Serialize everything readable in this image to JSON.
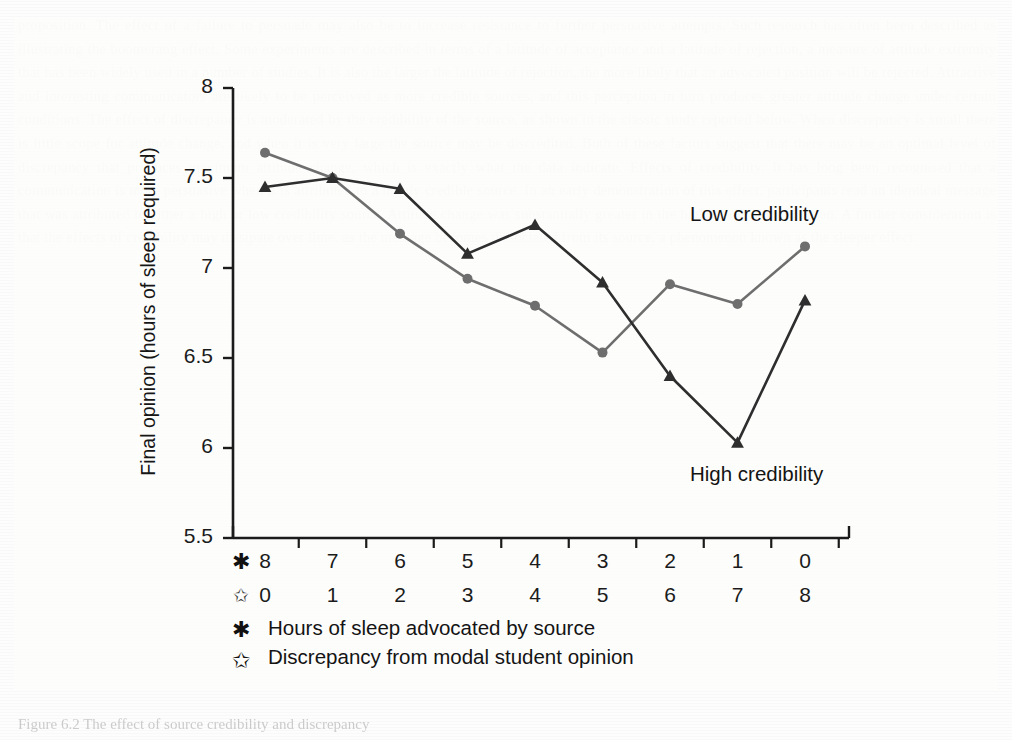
{
  "figure": {
    "caption": "Figure  6.2  The effect of source credibility and discrepancy",
    "y_axis_title": "Final opinion (hours of sleep required)",
    "series_annotations": [
      {
        "name": "low-credibility-label",
        "text": "Low credibility"
      },
      {
        "name": "high-credibility-label",
        "text": "High credibility"
      }
    ],
    "axis_row_symbols": {
      "advocated": "✱",
      "discrepancy": "✩"
    },
    "legend": [
      {
        "symbol": "✱",
        "label": "Hours of sleep advocated by source"
      },
      {
        "symbol": "✩",
        "label": "Discrepancy from modal student opinion"
      }
    ],
    "colors": {
      "low_credibility": "#6e6e6e",
      "high_credibility": "#2e2e2e",
      "axis": "#1b1b1b",
      "text": "#141414",
      "panel_background": "#fcfcfb"
    }
  },
  "chart_data": {
    "type": "line",
    "title": "",
    "xlabel": "",
    "ylabel": "Final opinion (hours of sleep required)",
    "ylim": [
      5.5,
      8
    ],
    "yticks": [
      "8",
      "7.5",
      "7",
      "6.5",
      "6",
      "5.5"
    ],
    "ytick_values": [
      8,
      7.5,
      7,
      6.5,
      6,
      5.5
    ],
    "grid": false,
    "legend_position": "inline-annotations",
    "categories": [
      "8",
      "7",
      "6",
      "5",
      "4",
      "3",
      "2",
      "1",
      "0"
    ],
    "x_axis_rows": [
      {
        "symbol": "✱",
        "name": "hours-advocated",
        "labels": [
          "8",
          "7",
          "6",
          "5",
          "4",
          "3",
          "2",
          "1",
          "0"
        ]
      },
      {
        "symbol": "✩",
        "name": "discrepancy",
        "labels": [
          "0",
          "1",
          "2",
          "3",
          "4",
          "5",
          "6",
          "7",
          "8"
        ]
      }
    ],
    "series": [
      {
        "name": "Low credibility",
        "marker": "circle",
        "color": "#6e6e6e",
        "values": [
          7.64,
          7.5,
          7.19,
          6.94,
          6.79,
          6.53,
          6.91,
          6.8,
          7.12
        ]
      },
      {
        "name": "High credibility",
        "marker": "triangle",
        "color": "#2e2e2e",
        "values": [
          7.45,
          7.5,
          7.44,
          7.08,
          7.24,
          6.92,
          6.4,
          6.03,
          6.82
        ]
      }
    ]
  },
  "ghost_page_text": "proposition. The effect of a failure to persuade may also be to increase resistance to further persuasive attempts. Such research has often been described as illustrating the boomerang effect. Some experiments are described in terms of a latitude of acceptance and a latitude of rejection, a measure of attitude extremity that has been widely used in a number of studies. It is also the larger the latitude of rejection, the more likely that an advocated position will be rejected. Attractive and interesting communicators are likely to be perceived as more credible sources, and this perception in turn produces greater attitude change under certain conditions. The effect of discrepancy is moderated by the credibility of the source, as shown in the classic study reported below. When discrepancy is small there is little scope for attitude change, and when it is very large the source may be discredited. Both of these factors suggest that there may be an optimal level of discrepancy that produces maximum attitude change, which is exactly what the data indicate. Effects of credibility. It has long been recognised that a communication is more persuasive when it is attributed to a highly credible source. In an early demonstration of this effect, participants read an identical message that was attributed to either a high or low credibility source. Attitude change was substantially greater in the high credibility condition. A further consideration is that the effects of credibility may dissipate over time, as the message becomes dissociated from its source, a phenomenon known as the sleeper effect."
}
